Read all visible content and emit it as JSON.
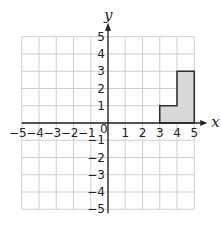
{
  "diagram": {
    "type": "coordinate-grid",
    "axes": {
      "x_label": "x",
      "y_label": "y",
      "x_range": [
        -5,
        5
      ],
      "y_range": [
        -5,
        5
      ]
    },
    "x_ticks": [
      "−5",
      "−4",
      "−3",
      "−2",
      "−1",
      "0",
      "1",
      "2",
      "3",
      "4",
      "5"
    ],
    "y_ticks": [
      "5",
      "4",
      "3",
      "2",
      "1",
      "−1",
      "−2",
      "−3",
      "−4",
      "−5"
    ],
    "shape": {
      "fill": "#d9d9d9",
      "stroke": "#333333",
      "vertices": [
        [
          3,
          0
        ],
        [
          5,
          0
        ],
        [
          5,
          3
        ],
        [
          4,
          3
        ],
        [
          4,
          1
        ],
        [
          3,
          1
        ]
      ]
    },
    "colors": {
      "grid": "#cfcfcf",
      "axis": "#222222"
    }
  }
}
